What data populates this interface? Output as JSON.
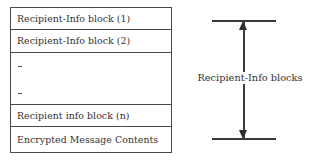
{
  "diagram": {
    "background_color": "#ffffff",
    "line_color": "#4a4a4a",
    "text_color": "#34312f",
    "table": {
      "rows": [
        {
          "label": "Recipient-Info block (1)",
          "kind": "block"
        },
        {
          "label": "Recipient-Info block (2)",
          "kind": "block"
        },
        {
          "label": "",
          "kind": "ellipsis",
          "marks": [
            "-",
            "-"
          ]
        },
        {
          "label": "Recipient info block (n)",
          "kind": "block"
        },
        {
          "label": "Encrypted Message Contents",
          "kind": "contents"
        }
      ]
    },
    "annotation": {
      "label": "Recipient-Info blocks",
      "arrow_style": "double-headed-vertical",
      "cap_style": "horizontal-bar",
      "spans_rows": [
        1,
        4
      ]
    }
  }
}
